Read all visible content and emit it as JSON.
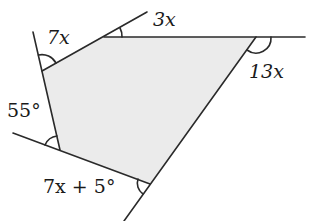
{
  "figure": {
    "type": "pentagon-exterior-angles",
    "fill_color": "#ebebeb",
    "stroke_color": "#2a2a2a",
    "vertices": {
      "A": [
        42,
        71
      ],
      "B": [
        104,
        37
      ],
      "C": [
        256,
        37
      ],
      "D": [
        150,
        184
      ],
      "E": [
        60,
        150
      ]
    },
    "extensions": {
      "EA_beyond_A": [
        33,
        32
      ],
      "AB_beyond_B": [
        147,
        12
      ],
      "BC_beyond_C": [
        305,
        37
      ],
      "CD_beyond_D": [
        124,
        221
      ],
      "DE_beyond_E": [
        13,
        133
      ]
    }
  },
  "labels": {
    "angle_a": "7x",
    "angle_b": "3x",
    "angle_c": "13x",
    "angle_d": "7x + 5°",
    "angle_e": "55°"
  }
}
